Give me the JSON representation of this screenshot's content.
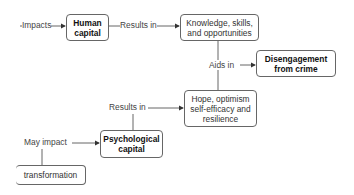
{
  "nodes": {
    "human_capital": "Human capital",
    "knowledge": "Knowledge, skills, and opportunities",
    "disengagement": "Disengagement from crime",
    "hope": "Hope, optimism self-efficacy and resilience",
    "psychological_capital": "Psychological capital",
    "transformation": "transformation"
  },
  "edges": {
    "impacts": "Impacts",
    "results_in_1": "Results in",
    "aids_in": "Aids in",
    "results_in_2": "Results in",
    "may_impact": "May impact"
  },
  "colors": {
    "line": "#555555",
    "border": "#666666",
    "text": "#333333"
  }
}
